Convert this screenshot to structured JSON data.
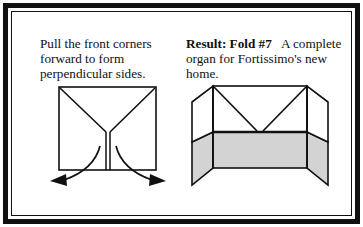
{
  "figure": {
    "width": 363,
    "height": 227,
    "background": "#ffffff",
    "frame_color": "#111111",
    "frame_style": "double-rule"
  },
  "panels": {
    "left": {
      "caption": "Pull the front corners\nforward to form\nperpendicular sides.",
      "caption_lines": [
        "Pull the front corners",
        "forward to form",
        "perpendicular sides."
      ],
      "diagram_name": "flat-square-with-y-crease",
      "diagram_description": "Square sheet seen flat-on with two diagonal crease lines from the top corners meeting at the centre, and a narrow vertical slot running from that meeting point down to the bottom edge. Two curved arrows below show the front corners being pulled forward and outward.",
      "arrows": [
        {
          "label": "pull-left-corner-forward",
          "direction": "down-left"
        },
        {
          "label": "pull-right-corner-forward",
          "direction": "down-right"
        }
      ]
    },
    "right": {
      "caption_bold": "Result: Fold #7",
      "caption_rest": "A complete organ for Fortissimo's new home.",
      "caption_lines": [
        "Result: Fold #7   A",
        "complete organ for",
        "Fortissimo's new home."
      ],
      "diagram_name": "finished-organ-three-panel-stand",
      "diagram_description": "Three-quarter perspective of the finished model: a tall back panel with two side wings folded forward at right angles, the lower half of every panel shaded grey, and a V of crease lines in the open upper section.",
      "fill_color": "#d3d3d3",
      "line_color": "#111111"
    }
  }
}
